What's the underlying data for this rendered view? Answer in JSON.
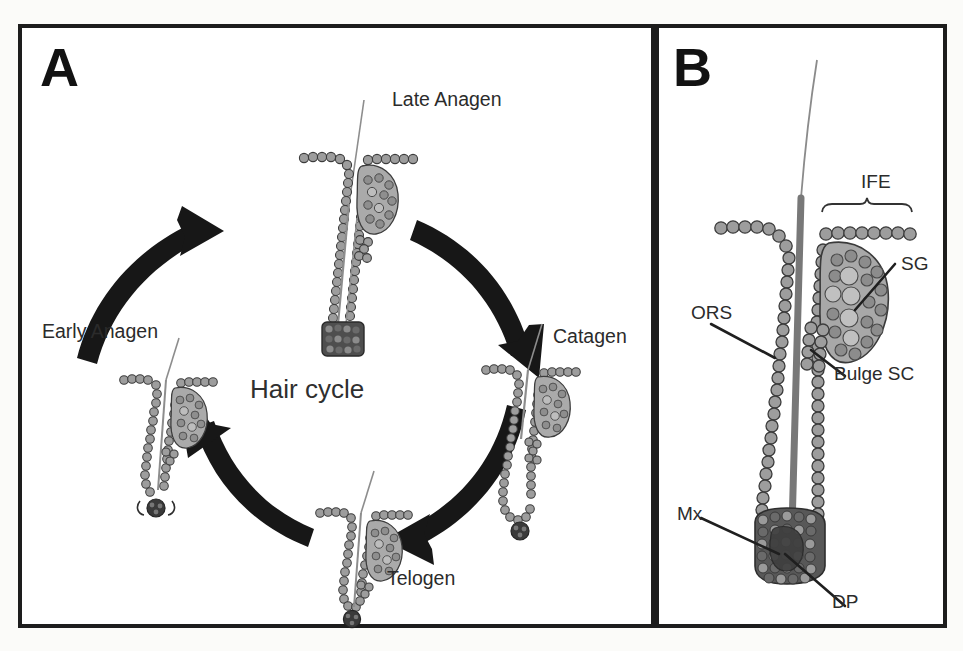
{
  "figure": {
    "background_color": "#fbfbf9",
    "border_color": "#1d1d1d",
    "cell_fill": "#9a9a9a",
    "cell_stroke": "#3a3a3a",
    "dark_cell_fill": "#4a4a4a",
    "hair_shaft_color": "#6e6e6e",
    "arrow_color": "#171717",
    "label_color": "#2b2b2b"
  },
  "panels": [
    {
      "id": "A",
      "letter": "A",
      "center_label": "Hair cycle",
      "stages": [
        {
          "key": "late-anagen",
          "label": "Late Anagen",
          "label_x": 388,
          "label_y": 86,
          "position": "top"
        },
        {
          "key": "catagen",
          "label": "Catagen",
          "label_x": 549,
          "label_y": 323,
          "position": "right"
        },
        {
          "key": "telogen",
          "label": "Telogen",
          "label_x": 383,
          "label_y": 565,
          "position": "bottom"
        },
        {
          "key": "early-anagen",
          "label": "Early Anagen",
          "label_x": 38,
          "label_y": 318,
          "position": "left"
        }
      ],
      "arrows": [
        {
          "key": "arrow-early-to-late",
          "from": "early-anagen",
          "to": "late-anagen",
          "direction": "clockwise-up-right"
        },
        {
          "key": "arrow-late-to-catagen",
          "from": "late-anagen",
          "to": "catagen",
          "direction": "clockwise-down-right"
        },
        {
          "key": "arrow-catagen-to-telogen",
          "from": "catagen",
          "to": "telogen",
          "direction": "clockwise-down-left"
        },
        {
          "key": "arrow-telogen-to-early",
          "from": "telogen",
          "to": "early-anagen",
          "direction": "clockwise-up-left"
        }
      ]
    },
    {
      "id": "B",
      "letter": "B",
      "annotations": [
        {
          "key": "ife",
          "label": "IFE",
          "label_x": 861,
          "label_y": 174,
          "has_bracket": true,
          "has_leader": false
        },
        {
          "key": "sg",
          "label": "SG",
          "label_x": 900,
          "label_y": 256,
          "has_bracket": false,
          "has_leader": true
        },
        {
          "key": "bulge-sc",
          "label": "Bulge SC",
          "label_x": 833,
          "label_y": 366,
          "has_bracket": false,
          "has_leader": true
        },
        {
          "key": "ors",
          "label": "ORS",
          "label_x": 690,
          "label_y": 305,
          "has_bracket": false,
          "has_leader": true
        },
        {
          "key": "mx",
          "label": "Mx",
          "label_x": 676,
          "label_y": 506,
          "has_bracket": false,
          "has_leader": true
        },
        {
          "key": "dp",
          "label": "DP",
          "label_x": 831,
          "label_y": 594,
          "has_bracket": false,
          "has_leader": true
        }
      ]
    }
  ]
}
